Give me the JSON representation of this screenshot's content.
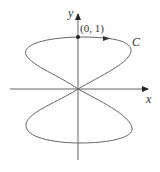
{
  "figure": {
    "type": "parametric-curve",
    "axes": {
      "x_label": "x",
      "y_label": "y"
    },
    "point": {
      "label": "(0, 1)",
      "x": 0,
      "y": 1
    },
    "curve_label": "C",
    "colors": {
      "curve": "#666666",
      "axes": "#555555",
      "point": "#222222"
    }
  }
}
